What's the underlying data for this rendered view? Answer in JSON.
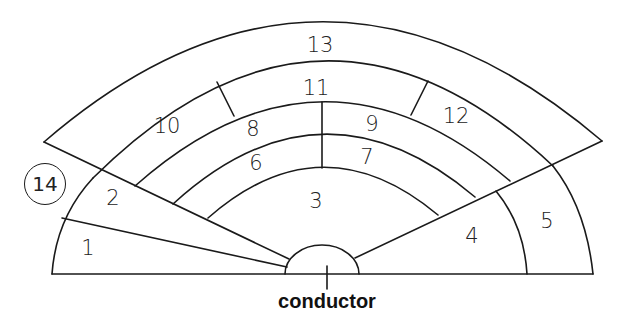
{
  "diagram": {
    "type": "orchestra seating chart",
    "sections": [
      {
        "id": "1",
        "label": "1"
      },
      {
        "id": "2",
        "label": "2"
      },
      {
        "id": "3",
        "label": "3"
      },
      {
        "id": "4",
        "label": "4"
      },
      {
        "id": "5",
        "label": "5"
      },
      {
        "id": "6",
        "label": "6"
      },
      {
        "id": "7",
        "label": "7"
      },
      {
        "id": "8",
        "label": "8"
      },
      {
        "id": "9",
        "label": "9"
      },
      {
        "id": "10",
        "label": "10"
      },
      {
        "id": "11",
        "label": "11"
      },
      {
        "id": "12",
        "label": "12"
      },
      {
        "id": "13",
        "label": "13"
      },
      {
        "id": "14",
        "label": "14"
      }
    ],
    "podium_label": "conductor",
    "colors": {
      "stroke": "#1a1a1a",
      "background": "#ffffff"
    }
  }
}
